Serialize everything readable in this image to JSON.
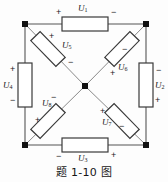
{
  "figure": {
    "caption": "题 1-10 图",
    "type": "circuit-schematic"
  },
  "colors": {
    "wire": "#555555",
    "resistor_stroke": "#3a3a3a",
    "resistor_fill": "#ffffff",
    "node": "#111111",
    "text": "#1a1a1a",
    "background": "#fdfdfd"
  },
  "nodes": [
    {
      "name": "top-left",
      "x": 25,
      "y": 24
    },
    {
      "name": "top-right",
      "x": 146,
      "y": 24
    },
    {
      "name": "bottom-right",
      "x": 146,
      "y": 145
    },
    {
      "name": "bottom-left",
      "x": 25,
      "y": 145
    },
    {
      "name": "center",
      "x": 85,
      "y": 86
    }
  ],
  "elements": [
    {
      "id": "u1",
      "label": "U",
      "subscript": "1",
      "position": "top-edge",
      "orientation": "horizontal",
      "plus": "left",
      "minus": "right"
    },
    {
      "id": "u2",
      "label": "U",
      "subscript": "2",
      "position": "right-edge",
      "orientation": "vertical",
      "plus": "bottom",
      "minus": "top"
    },
    {
      "id": "u3",
      "label": "U",
      "subscript": "3",
      "position": "bottom-edge",
      "orientation": "horizontal",
      "plus": "right",
      "minus": "left"
    },
    {
      "id": "u4",
      "label": "U",
      "subscript": "4",
      "position": "left-edge",
      "orientation": "vertical",
      "plus": "top",
      "minus": "bottom"
    },
    {
      "id": "u5",
      "label": "U",
      "subscript": "5",
      "position": "diagonal-upper-left",
      "orientation": "diagonal-down-right",
      "plus": "upper-left",
      "minus": "lower-right"
    },
    {
      "id": "u6",
      "label": "U",
      "subscript": "6",
      "position": "diagonal-upper-right",
      "orientation": "diagonal-down-left",
      "plus": "lower-left",
      "minus": "upper-right"
    },
    {
      "id": "u7",
      "label": "U",
      "subscript": "7",
      "position": "diagonal-lower-right",
      "orientation": "diagonal-down-right",
      "plus": "upper-left",
      "minus": "lower-right"
    },
    {
      "id": "u8",
      "label": "U",
      "subscript": "8",
      "position": "diagonal-lower-left",
      "orientation": "diagonal-down-left",
      "plus": "lower-left",
      "minus": "upper-right"
    }
  ],
  "signs": {
    "plus": "+",
    "minus": "−"
  }
}
